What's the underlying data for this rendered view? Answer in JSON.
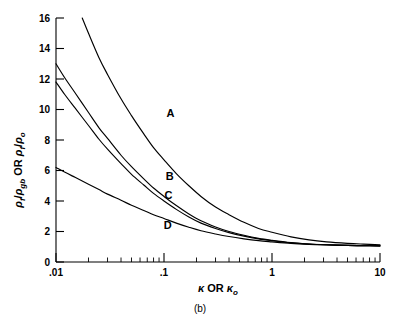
{
  "figure": {
    "caption": "(b)",
    "background_color": "#ffffff",
    "line_color": "#000000"
  },
  "chart_data": {
    "type": "line",
    "title": "",
    "subtitle": "",
    "caption": "(b)",
    "xlabel": "κ OR κₒ",
    "xlabel_parts": {
      "sym1": "κ",
      "conj": "OR",
      "sym2": "κ",
      "sym2_sub": "o"
    },
    "ylabel": "ρ_f/ρ_gb OR ρ_f/ρ_o",
    "ylabel_parts": {
      "num1": "ρ",
      "num1_sub": "f",
      "den1": "ρ",
      "den1_sub": "gb",
      "conj": "OR",
      "num2": "ρ",
      "num2_sub": "f",
      "den2": "ρ",
      "den2_sub": "o"
    },
    "xscale": "log",
    "yscale": "linear",
    "xlim": [
      0.01,
      10
    ],
    "ylim": [
      0,
      16
    ],
    "grid": false,
    "legend": "inline-curve-labels",
    "xticks": [
      0.01,
      0.1,
      1,
      10
    ],
    "xtick_labels": [
      ".01",
      ".1",
      "1",
      "10"
    ],
    "yticks": [
      0,
      2,
      4,
      6,
      8,
      10,
      12,
      14,
      16
    ],
    "ytick_labels": [
      "0",
      "2",
      "4",
      "6",
      "8",
      "10",
      "12",
      "14",
      "16"
    ],
    "series": [
      {
        "name": "A",
        "label": "A",
        "label_x": 0.115,
        "label_y": 9.5,
        "x": [
          0.0175,
          0.02,
          0.025,
          0.03,
          0.04,
          0.05,
          0.065,
          0.08,
          0.1,
          0.13,
          0.17,
          0.22,
          0.3,
          0.4,
          0.55,
          0.75,
          1.0,
          1.5,
          2.2,
          3.2,
          5.0,
          7.0,
          10.0
        ],
        "y": [
          16.0,
          15.0,
          13.4,
          12.3,
          10.7,
          9.6,
          8.4,
          7.5,
          6.7,
          5.8,
          5.0,
          4.3,
          3.6,
          3.1,
          2.6,
          2.2,
          1.95,
          1.65,
          1.45,
          1.32,
          1.22,
          1.17,
          1.13
        ]
      },
      {
        "name": "B",
        "label": "B",
        "label_x": 0.113,
        "label_y": 5.35,
        "x": [
          0.01,
          0.012,
          0.015,
          0.02,
          0.025,
          0.03,
          0.04,
          0.05,
          0.065,
          0.08,
          0.1,
          0.13,
          0.17,
          0.22,
          0.3,
          0.4,
          0.55,
          0.75,
          1.0,
          1.5,
          2.2,
          3.2,
          5.0,
          7.0,
          10.0
        ],
        "y": [
          13.0,
          12.1,
          11.1,
          9.8,
          8.8,
          8.1,
          7.0,
          6.25,
          5.45,
          4.85,
          4.3,
          3.7,
          3.15,
          2.7,
          2.3,
          2.0,
          1.75,
          1.55,
          1.42,
          1.27,
          1.18,
          1.13,
          1.09,
          1.07,
          1.06
        ]
      },
      {
        "name": "C",
        "label": "C",
        "label_x": 0.11,
        "label_y": 4.1,
        "x": [
          0.01,
          0.012,
          0.015,
          0.02,
          0.025,
          0.03,
          0.04,
          0.05,
          0.065,
          0.08,
          0.1,
          0.13,
          0.17,
          0.22,
          0.3,
          0.4,
          0.55,
          0.75,
          1.0,
          1.5,
          2.2,
          3.2,
          5.0,
          7.0,
          10.0
        ],
        "y": [
          11.8,
          11.0,
          10.1,
          8.95,
          8.05,
          7.4,
          6.45,
          5.75,
          5.05,
          4.5,
          4.0,
          3.45,
          2.95,
          2.55,
          2.2,
          1.93,
          1.7,
          1.52,
          1.4,
          1.26,
          1.18,
          1.13,
          1.09,
          1.07,
          1.06
        ]
      },
      {
        "name": "D",
        "label": "D",
        "label_x": 0.108,
        "label_y": 2.15,
        "x": [
          0.01,
          0.012,
          0.015,
          0.02,
          0.025,
          0.03,
          0.04,
          0.05,
          0.065,
          0.08,
          0.1,
          0.13,
          0.17,
          0.22,
          0.3,
          0.4,
          0.55,
          0.75,
          1.0,
          1.5,
          2.2,
          3.2,
          5.0,
          7.0,
          10.0
        ],
        "y": [
          6.2,
          5.9,
          5.55,
          5.1,
          4.75,
          4.45,
          4.05,
          3.72,
          3.38,
          3.1,
          2.85,
          2.55,
          2.28,
          2.05,
          1.84,
          1.67,
          1.52,
          1.4,
          1.32,
          1.22,
          1.16,
          1.12,
          1.09,
          1.07,
          1.06
        ]
      }
    ]
  }
}
